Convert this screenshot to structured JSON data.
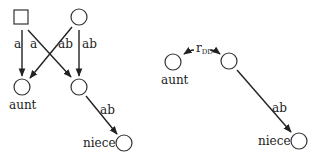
{
  "left_diagram": {
    "nodes": {
      "square": {
        "shape": "square",
        "label": ""
      },
      "top_circle": {
        "shape": "circle",
        "label": ""
      },
      "aunt": {
        "shape": "circle",
        "label": "aunt"
      },
      "middle": {
        "shape": "circle",
        "label": ""
      },
      "niece": {
        "shape": "circle",
        "label": "niece"
      }
    },
    "edges": [
      {
        "from": "square",
        "to": "aunt",
        "label": "a"
      },
      {
        "from": "square",
        "to": "middle",
        "label": "a"
      },
      {
        "from": "top_circle",
        "to": "aunt",
        "label": "ab"
      },
      {
        "from": "top_circle",
        "to": "middle",
        "label": "ab"
      },
      {
        "from": "middle",
        "to": "niece",
        "label": "ab"
      }
    ]
  },
  "right_diagram": {
    "nodes": {
      "aunt": {
        "shape": "circle",
        "label": "aunt"
      },
      "middle": {
        "shape": "circle",
        "label": ""
      },
      "niece": {
        "shape": "circle",
        "label": "niece"
      }
    },
    "edges": [
      {
        "from": "aunt",
        "to": "middle",
        "label_main": "r",
        "label_sub": "DD",
        "bidirectional": true
      },
      {
        "from": "middle",
        "to": "niece",
        "label": "ab"
      }
    ]
  }
}
